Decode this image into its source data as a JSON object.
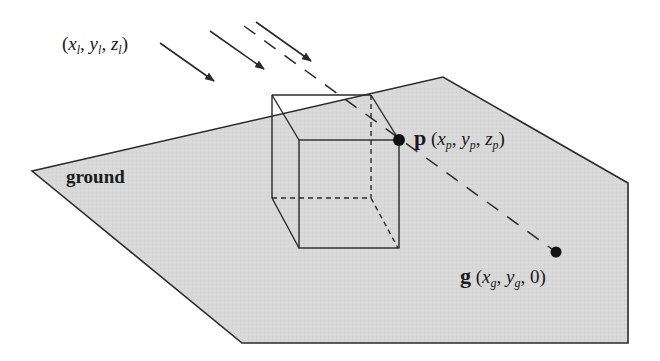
{
  "diagram": {
    "type": "shadow-projection",
    "colors": {
      "ground_fill": "#d6d6d6",
      "stroke": "#2a2a2a",
      "background": "#ffffff"
    },
    "ground": {
      "label": "ground",
      "polygon": [
        [
          32,
          171
        ],
        [
          443,
          77
        ],
        [
          628,
          183
        ],
        [
          628,
          343
        ],
        [
          242,
          343
        ]
      ]
    },
    "light": {
      "label_open": "(",
      "x": "x",
      "x_sub": "l",
      "y": "y",
      "y_sub": "l",
      "z": "z",
      "z_sub": "l",
      "sep": ", ",
      "label_close": ")"
    },
    "point_p": {
      "name": "p",
      "x": "x",
      "x_sub": "p",
      "y": "y",
      "y_sub": "p",
      "z": "z",
      "z_sub": "p",
      "open": "(",
      "close": ")",
      "sep": ", "
    },
    "point_g": {
      "name": "g",
      "x": "x",
      "x_sub": "g",
      "y": "y",
      "y_sub": "g",
      "z": "0",
      "open": "(",
      "close": ")",
      "sep": ", "
    }
  }
}
